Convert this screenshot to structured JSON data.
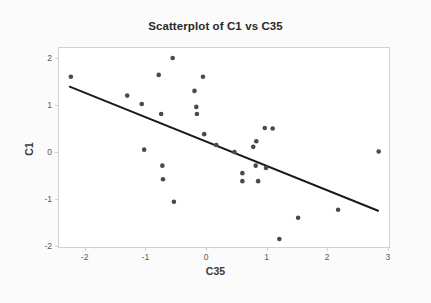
{
  "chart_data": {
    "type": "scatter",
    "title": "Scatterplot of C1 vs C35",
    "xlabel": "C35",
    "ylabel": "C1",
    "xlim": [
      -2.42,
      3.04
    ],
    "ylim": [
      -2.16,
      2.23
    ],
    "xticks": [
      "-2",
      "-1",
      "0",
      "1",
      "2",
      "3"
    ],
    "xtick_values": [
      -2,
      -1,
      0,
      1,
      2,
      3
    ],
    "yticks": [
      "2",
      "1",
      "0",
      "-1",
      "-2"
    ],
    "ytick_values": [
      2,
      1,
      0,
      -1,
      -2
    ],
    "grid": false,
    "legend": null,
    "marker_color": "#4a4a4a",
    "line_color": "#1a1a1a",
    "frame_color": "#d2d2d2",
    "background": "#ffffff",
    "points": [
      {
        "x": -2.23,
        "y": 1.6
      },
      {
        "x": -1.3,
        "y": 1.2
      },
      {
        "x": -1.06,
        "y": 1.02
      },
      {
        "x": -1.02,
        "y": 0.05
      },
      {
        "x": -0.78,
        "y": 1.64
      },
      {
        "x": -0.74,
        "y": 0.81
      },
      {
        "x": -0.72,
        "y": -0.29
      },
      {
        "x": -0.71,
        "y": -0.58
      },
      {
        "x": -0.55,
        "y": 2.0
      },
      {
        "x": -0.53,
        "y": -1.06
      },
      {
        "x": -0.19,
        "y": 1.3
      },
      {
        "x": -0.16,
        "y": 0.96
      },
      {
        "x": -0.15,
        "y": 0.81
      },
      {
        "x": -0.05,
        "y": 1.6
      },
      {
        "x": -0.03,
        "y": 0.38
      },
      {
        "x": 0.17,
        "y": 0.15
      },
      {
        "x": 0.47,
        "y": 0.0
      },
      {
        "x": 0.6,
        "y": -0.45
      },
      {
        "x": 0.6,
        "y": -0.62
      },
      {
        "x": 0.78,
        "y": 0.11
      },
      {
        "x": 0.83,
        "y": 0.23
      },
      {
        "x": 0.82,
        "y": -0.29
      },
      {
        "x": 0.86,
        "y": -0.62
      },
      {
        "x": 0.97,
        "y": 0.51
      },
      {
        "x": 1.1,
        "y": 0.5
      },
      {
        "x": 0.99,
        "y": -0.34
      },
      {
        "x": 1.21,
        "y": -1.85
      },
      {
        "x": 1.52,
        "y": -1.4
      },
      {
        "x": 2.18,
        "y": -1.23
      },
      {
        "x": 2.85,
        "y": 0.01
      }
    ],
    "fit_line": {
      "x1": -2.25,
      "y1": 1.39,
      "x2": 2.84,
      "y2": -1.25
    }
  }
}
